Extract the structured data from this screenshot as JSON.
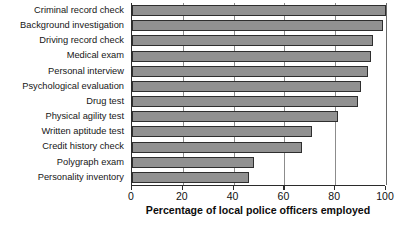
{
  "chart_data": {
    "type": "bar",
    "orientation": "horizontal",
    "title": "",
    "xlabel": "Percentage of local police officers employed",
    "ylabel": "",
    "xlim": [
      0,
      100
    ],
    "xticks": [
      0,
      20,
      40,
      60,
      80,
      100
    ],
    "xticklabels": [
      "0",
      "20",
      "40",
      "60",
      "80",
      "100"
    ],
    "grid": true,
    "grid_axis": "x",
    "legend": false,
    "bar_color": "#919191",
    "bar_edge_color": "#2e2e2e",
    "categories": [
      "Criminal record check",
      "Background investigation",
      "Driving record check",
      "Medical exam",
      "Personal interview",
      "Psychological evaluation",
      "Drug test",
      "Physical agility test",
      "Written aptitude test",
      "Credit history check",
      "Polygraph exam",
      "Personality inventory"
    ],
    "values": [
      100,
      99,
      95,
      94,
      93,
      90,
      89,
      81,
      71,
      67,
      48,
      46
    ]
  }
}
